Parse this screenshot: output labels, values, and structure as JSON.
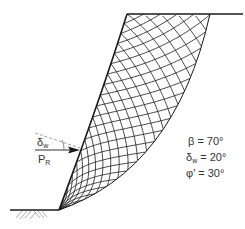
{
  "figure": {
    "type": "slope stability slip-line field (passive resistance)",
    "force_label": "P",
    "force_subscript": "R",
    "angle_label": "δ",
    "angle_subscript": "w",
    "parameters": [
      {
        "symbol": "β",
        "subscript": "",
        "value": "= 70°"
      },
      {
        "symbol": "δ",
        "subscript": "w",
        "value": "= 20°"
      },
      {
        "symbol": "φ′",
        "subscript": "",
        "value": "= 30°"
      }
    ]
  },
  "colors": {
    "line": "#1a1a1a",
    "dashed": "#777777",
    "hatch": "#888888",
    "text": "#333333"
  }
}
